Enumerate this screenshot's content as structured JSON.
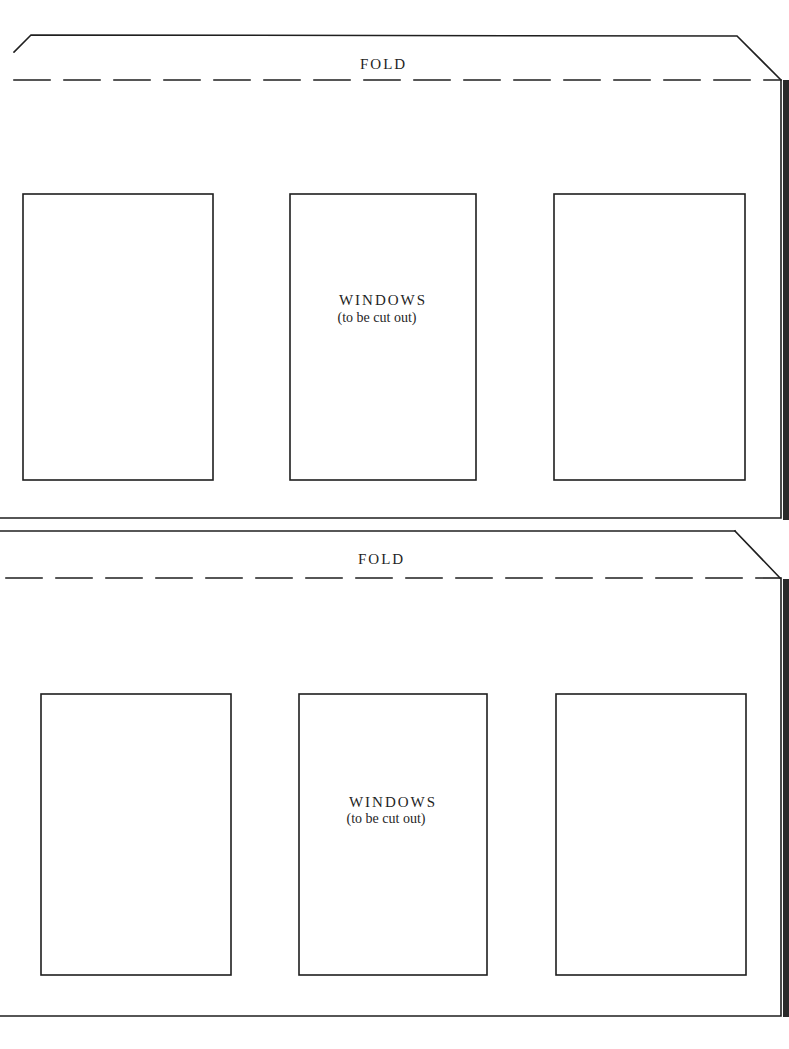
{
  "template": {
    "colors": {
      "ink": "#1f1f1f",
      "paper": "#ffffff",
      "edge": "#2a2a2a"
    },
    "panels": [
      {
        "fold_label": "FOLD",
        "windows_title": "WINDOWS",
        "windows_subtitle": "(to be cut out)",
        "window_count": 3
      },
      {
        "fold_label": "FOLD",
        "windows_title": "WINDOWS",
        "windows_subtitle": "(to be cut out)",
        "window_count": 3
      }
    ]
  }
}
